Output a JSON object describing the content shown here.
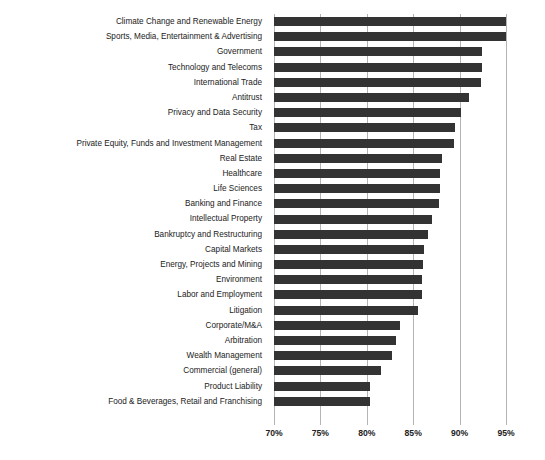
{
  "chart_data": {
    "type": "bar",
    "orientation": "horizontal",
    "title": "",
    "subtitle": "",
    "xlabel": "",
    "ylabel": "",
    "xlim": [
      70,
      95
    ],
    "ylim": null,
    "grid": true,
    "grid_axis": "x",
    "legend": false,
    "legend_position": "none",
    "tick_format": "percent",
    "xticks": [
      70,
      75,
      80,
      85,
      90,
      95
    ],
    "xtick_labels": [
      "70%",
      "75%",
      "80%",
      "85%",
      "90%",
      "95%"
    ],
    "bar_color": "#333333",
    "gridline_color": "#b4b4b4",
    "background_color": "#ffffff",
    "categories": [
      "Climate Change and Renewable Energy",
      "Sports, Media, Entertainment & Advertising",
      "Government",
      "Technology and Telecoms",
      "International Trade",
      "Antitrust",
      "Privacy and Data Security",
      "Tax",
      "Private Equity, Funds and Investment Management",
      "Real Estate",
      "Healthcare",
      "Life Sciences",
      "Banking and Finance",
      "Intellectual Property",
      "Bankruptcy and Restructuring",
      "Capital Markets",
      "Energy, Projects and Mining",
      "Environment",
      "Labor and Employment",
      "Litigation",
      "Corporate/M&A",
      "Arbitration",
      "Wealth Management",
      "Commercial (general)",
      "Product Liability",
      "Food & Beverages, Retail and Franchising"
    ],
    "values": [
      96.2,
      95.6,
      92.4,
      92.4,
      92.3,
      91.0,
      90.2,
      89.5,
      89.4,
      88.1,
      87.9,
      87.9,
      87.8,
      87.0,
      86.6,
      86.2,
      86.1,
      86.0,
      85.9,
      85.5,
      83.6,
      83.2,
      82.7,
      81.5,
      80.3,
      80.3
    ],
    "value_labels": [
      "96.2%",
      "95.6%",
      "92.4%",
      "92.4%",
      "92.3%",
      "91.0%",
      "90.2%",
      "89.5%",
      "89.4%",
      "88.1%",
      "87.9%",
      "87.9%",
      "87.8%",
      "87.0%",
      "86.6%",
      "86.2%",
      "86.1%",
      "86.0%",
      "85.9%",
      "85.5%",
      "83.6%",
      "83.2%",
      "82.7%",
      "81.5%",
      "80.3%",
      "80.3%"
    ]
  }
}
